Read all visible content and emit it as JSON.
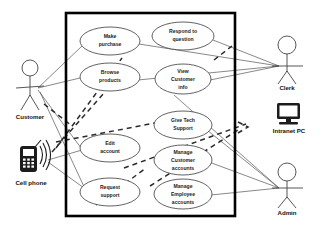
{
  "diagram": {
    "type": "uml-use-case-diagram",
    "background_color": "#ffffff",
    "boundary": {
      "name": "system-boundary",
      "x": 66,
      "y": 13,
      "width": 169,
      "height": 203,
      "stroke_color": "#000000",
      "label": ""
    },
    "use_cases": [
      {
        "id": "make-purchase",
        "label_lines": [
          "Make",
          "purchase"
        ],
        "cx": 110,
        "cy": 41,
        "rx": 30,
        "ry": 14
      },
      {
        "id": "browse-products",
        "label_lines": [
          "Browse",
          "products"
        ],
        "cx": 110,
        "cy": 77,
        "rx": 30,
        "ry": 14
      },
      {
        "id": "edit-account",
        "label_lines": [
          "Edit",
          "account"
        ],
        "cx": 110,
        "cy": 148,
        "rx": 30,
        "ry": 14
      },
      {
        "id": "request-support",
        "label_lines": [
          "Request",
          "support"
        ],
        "cx": 110,
        "cy": 192,
        "rx": 30,
        "ry": 14
      },
      {
        "id": "respond-to-question",
        "label_lines": [
          "Respond to",
          "question"
        ],
        "cx": 183,
        "cy": 36,
        "rx": 31,
        "ry": 14
      },
      {
        "id": "view-customer-info",
        "label_lines": [
          "View",
          "Customer",
          "info"
        ],
        "cx": 183,
        "cy": 79,
        "rx": 28,
        "ry": 15
      },
      {
        "id": "give-tech-support",
        "label_lines": [
          "Give Tech",
          "Support"
        ],
        "cx": 183,
        "cy": 125,
        "rx": 29,
        "ry": 14
      },
      {
        "id": "manage-customer-accounts",
        "label_lines": [
          "Manage",
          "Customer",
          "accounts"
        ],
        "cx": 183,
        "cy": 160,
        "rx": 29,
        "ry": 15
      },
      {
        "id": "manage-employee-accounts",
        "label_lines": [
          "Manage",
          "Employee",
          "accounts"
        ],
        "cx": 183,
        "cy": 194,
        "rx": 29,
        "ry": 15
      }
    ],
    "actors": [
      {
        "id": "customer",
        "label": "Customer",
        "kind": "stick-figure",
        "x": 30,
        "y": 78,
        "label_x": 30,
        "label_y": 116
      },
      {
        "id": "cell-phone",
        "label": "Cell phone",
        "kind": "mobile-device",
        "x": 28,
        "y": 155,
        "label_x": 30,
        "label_y": 182
      },
      {
        "id": "clerk",
        "label": "Clerk",
        "kind": "stick-figure",
        "x": 287,
        "y": 45,
        "label_x": 287,
        "label_y": 86
      },
      {
        "id": "intranet-pc",
        "label": "Intranet PC",
        "kind": "computer",
        "x": 288,
        "y": 111,
        "label_x": 289,
        "label_y": 129
      },
      {
        "id": "admin",
        "label": "Admin",
        "kind": "stick-figure",
        "x": 287,
        "y": 172,
        "label_x": 287,
        "label_y": 212
      }
    ],
    "associations": [
      {
        "from": "customer",
        "to": "make-purchase",
        "style": "solid"
      },
      {
        "from": "customer",
        "to": "browse-products",
        "style": "solid"
      },
      {
        "from": "customer",
        "to": "edit-account",
        "style": "solid"
      },
      {
        "from": "customer",
        "to": "request-support",
        "style": "solid"
      },
      {
        "from": "cell-phone",
        "to": "browse-products",
        "style": "dashed"
      },
      {
        "from": "cell-phone",
        "to": "make-purchase",
        "style": "dashed"
      },
      {
        "from": "cell-phone",
        "to": "give-tech-support",
        "style": "dashed"
      },
      {
        "from": "cell-phone",
        "to": "intranet-pc",
        "style": "dashed"
      },
      {
        "from": "clerk",
        "to": "respond-to-question",
        "style": "solid"
      },
      {
        "from": "clerk",
        "to": "view-customer-info",
        "style": "solid"
      },
      {
        "from": "clerk",
        "to": "make-purchase",
        "style": "solid"
      },
      {
        "from": "clerk",
        "to": "browse-products",
        "style": "solid"
      },
      {
        "from": "admin",
        "to": "give-tech-support",
        "style": "solid"
      },
      {
        "from": "admin",
        "to": "manage-customer-accounts",
        "style": "solid"
      },
      {
        "from": "admin",
        "to": "manage-employee-accounts",
        "style": "solid"
      },
      {
        "from": "admin",
        "to": "view-customer-info",
        "style": "solid"
      }
    ]
  }
}
